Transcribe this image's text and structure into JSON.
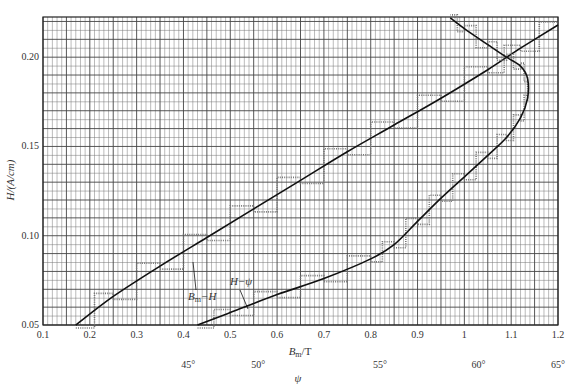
{
  "chart_data": {
    "type": "line",
    "title": "",
    "xlabel": "B_m/T",
    "ylabel": "H/(A/cm)",
    "secondary_xlabel": "ψ",
    "xlim": [
      0.1,
      1.2
    ],
    "ylim": [
      0.05,
      0.2225
    ],
    "grid": true,
    "grid_minor_x": 0.01,
    "grid_minor_y": 0.005,
    "x_ticks": [
      0.1,
      0.2,
      0.3,
      0.4,
      0.5,
      0.6,
      0.7,
      0.8,
      0.9,
      1.0,
      1.1,
      1.2
    ],
    "x_tick_labels": [
      "0.1",
      "0.2",
      "0.3",
      "0.4",
      "0.5",
      "0.6",
      "0.7",
      "0.8",
      "0.9",
      "1",
      "1.1",
      "1.2"
    ],
    "y_ticks": [
      0.05,
      0.1,
      0.15,
      0.2
    ],
    "y_tick_labels": [
      "0.05",
      "0.10",
      "0.15",
      "0.20"
    ],
    "psi_ticks": [
      {
        "label": "45°",
        "bm": 0.41
      },
      {
        "label": "50°",
        "bm": 0.56
      },
      {
        "label": "55°",
        "bm": 0.82
      },
      {
        "label": "60°",
        "bm": 1.03
      },
      {
        "label": "65°",
        "bm": 1.2
      }
    ],
    "series": [
      {
        "name": "B_m−H",
        "label_position": {
          "bm": 0.435,
          "h": 0.069
        },
        "x": [
          0.17,
          0.25,
          0.35,
          0.45,
          0.55,
          0.65,
          0.75,
          0.85,
          0.95,
          1.05,
          1.12,
          1.2
        ],
        "y": [
          0.05,
          0.066,
          0.083,
          0.099,
          0.115,
          0.131,
          0.147,
          0.162,
          0.177,
          0.193,
          0.205,
          0.218
        ]
      },
      {
        "name": "H−ψ",
        "label_position": {
          "bm": 0.515,
          "h": 0.066
        },
        "x": [
          0.43,
          0.5,
          0.6,
          0.7,
          0.8,
          0.85,
          0.9,
          0.95,
          1.0,
          1.05,
          1.09,
          1.12,
          1.135,
          1.135,
          1.12,
          1.09,
          1.05,
          1.0,
          0.97
        ],
        "y": [
          0.05,
          0.057,
          0.067,
          0.076,
          0.087,
          0.095,
          0.108,
          0.121,
          0.133,
          0.145,
          0.155,
          0.166,
          0.177,
          0.188,
          0.195,
          0.2,
          0.207,
          0.216,
          0.222
        ]
      }
    ]
  },
  "labels": {
    "title": "",
    "x_axis_title_main": "B",
    "x_axis_title_sub": "m",
    "x_axis_title_unit": "/T",
    "psi_axis_title": "ψ",
    "y_axis_title": "H/(A/cm)",
    "bm_h_label_main": "B",
    "bm_h_label_sub": "m",
    "bm_h_label_rest": "−H",
    "h_psi_label": "H−ψ"
  }
}
